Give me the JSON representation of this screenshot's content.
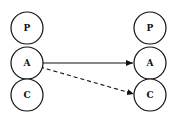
{
  "diagram": {
    "left_column": {
      "nodes": [
        {
          "id": "L-P",
          "label": "P",
          "cx": 27,
          "cy": 28
        },
        {
          "id": "L-A",
          "label": "A",
          "cy": 63,
          "cx": 27
        },
        {
          "id": "L-C",
          "label": "C",
          "cx": 27,
          "cy": 95
        }
      ]
    },
    "right_column": {
      "nodes": [
        {
          "id": "R-P",
          "label": "P",
          "cx": 150,
          "cy": 28
        },
        {
          "id": "R-A",
          "label": "A",
          "cx": 150,
          "cy": 63
        },
        {
          "id": "R-C",
          "label": "C",
          "cx": 150,
          "cy": 95
        }
      ]
    },
    "edges": [
      {
        "from": "L-A",
        "to": "R-A",
        "style": "solid"
      },
      {
        "from": "L-A",
        "to": "R-C",
        "style": "dashed"
      }
    ],
    "node_radius": 16,
    "stroke_color": "#111111"
  }
}
